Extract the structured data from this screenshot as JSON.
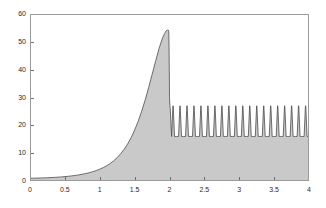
{
  "figure": {
    "background_color": "#ffffff",
    "plot_background_color": "#ffffff",
    "axis_color": "#9a9a9a",
    "tick_color": "#6d6d6d",
    "label_color": "#2b2b2b"
  },
  "chart_data": {
    "type": "area",
    "title": "",
    "subtitle": "",
    "xlabel": "",
    "ylabel": "",
    "xlim": [
      0,
      4
    ],
    "ylim": [
      0,
      60
    ],
    "grid": false,
    "legend": null,
    "legend_position": "none",
    "line_color": "#4d4d4d",
    "fill_color": "#c9c9c9",
    "line_width": 0.8,
    "xticks": [
      0,
      0.5,
      1,
      1.5,
      2,
      2.5,
      3,
      3.5,
      4
    ],
    "xtick_labels": [
      "0",
      "0.5",
      "1",
      "1.5",
      "2",
      "2.5",
      "3",
      "3.5",
      "4"
    ],
    "yticks": [
      0,
      10,
      20,
      30,
      40,
      50,
      60
    ],
    "ytick_labels": [
      "0",
      "10",
      "20",
      "30",
      "40",
      "50",
      "60"
    ],
    "annotations": [
      {
        "label": "peak",
        "x": 1.985,
        "y": 54.2
      },
      {
        "label": "post-peak drop",
        "x": 2.0,
        "y": 26.3
      },
      {
        "label": "oscillation max",
        "x": 2.05,
        "y": 27.0
      },
      {
        "label": "oscillation min",
        "x": 2.1,
        "y": 16.0
      }
    ],
    "series": [
      {
        "name": "f(x)",
        "x": [
          0,
          0.05,
          0.1,
          0.15,
          0.2,
          0.25,
          0.3,
          0.35,
          0.4,
          0.45,
          0.5,
          0.55,
          0.6,
          0.65,
          0.7,
          0.75,
          0.8,
          0.85,
          0.9,
          0.95,
          1,
          1.05,
          1.1,
          1.15,
          1.2,
          1.25,
          1.3,
          1.35,
          1.4,
          1.45,
          1.5,
          1.55,
          1.6,
          1.65,
          1.7,
          1.75,
          1.8,
          1.85,
          1.9,
          1.93,
          1.95,
          1.96,
          1.97,
          1.98,
          1.985,
          1.99,
          1.995,
          2.0,
          2.005,
          2.01
        ],
        "values": [
          1.0,
          1.02,
          1.05,
          1.08,
          1.12,
          1.17,
          1.23,
          1.3,
          1.38,
          1.47,
          1.58,
          1.7,
          1.84,
          2.0,
          2.2,
          2.42,
          2.68,
          2.98,
          3.33,
          3.75,
          4.25,
          4.82,
          5.5,
          6.3,
          7.25,
          8.4,
          9.8,
          11.4,
          13.3,
          15.6,
          18.3,
          21.4,
          25.0,
          29.0,
          33.5,
          38.2,
          43.0,
          47.6,
          51.4,
          53.0,
          53.9,
          54.1,
          54.2,
          54.1,
          54.2,
          53.6,
          45.0,
          30.0,
          27.2,
          26.3
        ]
      },
      {
        "name": "oscillation",
        "period": 0.1,
        "cycles": 20,
        "x_start": 2.0,
        "x_end": 4.0,
        "min": 16.0,
        "max": 27.0,
        "baseline": 16.0
      }
    ]
  },
  "axes": {
    "y_tick_positions_px": [
      181,
      153.2,
      125.3,
      97.5,
      69.7,
      41.8,
      14
    ],
    "x_tick_positions_px": [
      30,
      64.9,
      99.8,
      134.6,
      169.5,
      204.4,
      239.3,
      274.1,
      309
    ]
  }
}
